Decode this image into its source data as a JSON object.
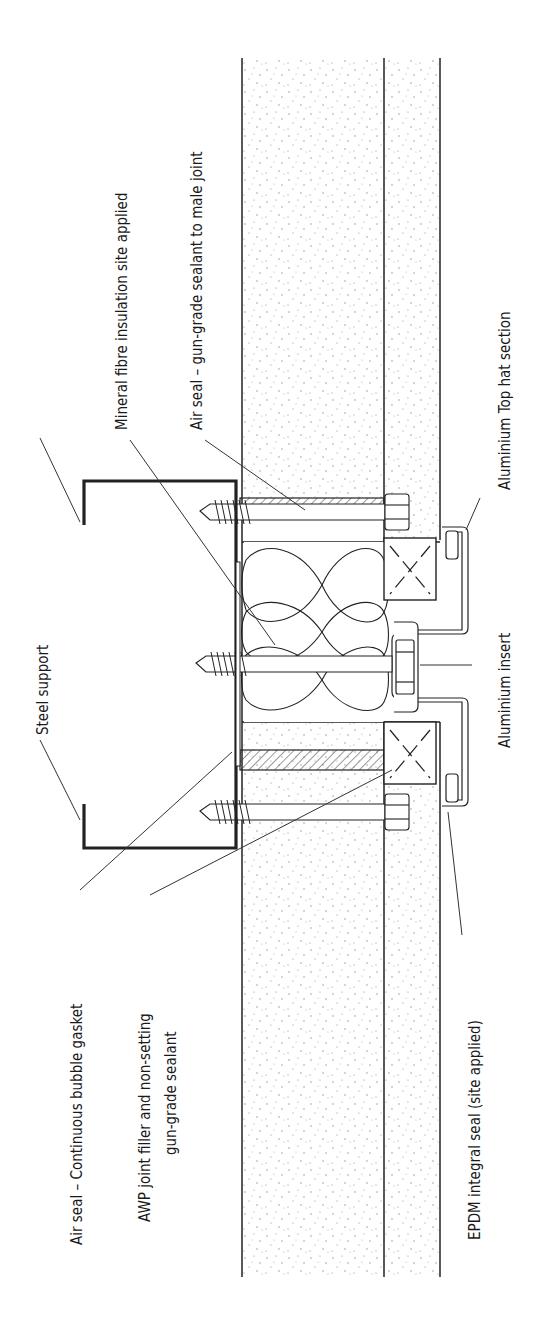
{
  "diagram": {
    "type": "construction-section-detail",
    "orientation": "rotated-90-ccw",
    "labels": {
      "steel_support": "Steel support",
      "air_seal_bubble_gasket": "Air seal – Continuous bubble gasket",
      "awp_filler_line1": "AWP joint filler and non-setting",
      "awp_filler_line2": "gun-grade sealant",
      "mineral_fibre": "Mineral fibre insulation site applied",
      "air_seal_male_joint": "Air seal – gun-grade sealant to male joint",
      "aluminium_top_hat": "Aluminium Top hat section",
      "aluminium_insert": "Aluminium insert",
      "epdm_seal": "EPDM integral seal (site applied)"
    },
    "colors": {
      "line": "#222222",
      "background": "#ffffff",
      "stipple": "#8a8a8a"
    }
  }
}
